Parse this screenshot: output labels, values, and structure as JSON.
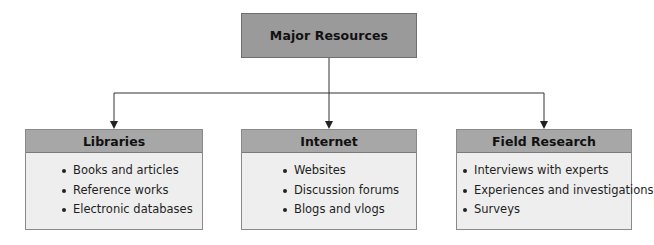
{
  "diagram": {
    "root": {
      "title": "Major Resources"
    },
    "children": [
      {
        "title": "Libraries",
        "items": [
          "Books and articles",
          "Reference works",
          "Electronic databases"
        ]
      },
      {
        "title": "Internet",
        "items": [
          "Websites",
          "Discussion forums",
          "Blogs and vlogs"
        ]
      },
      {
        "title": "Field Research",
        "items": [
          "Interviews with experts",
          "Experiences and investigations",
          "Surveys"
        ]
      }
    ]
  },
  "colors": {
    "root_fill": "#9a9a9a",
    "header_fill": "#a7a7a7",
    "body_fill": "#eeeeee",
    "line": "#333333"
  }
}
